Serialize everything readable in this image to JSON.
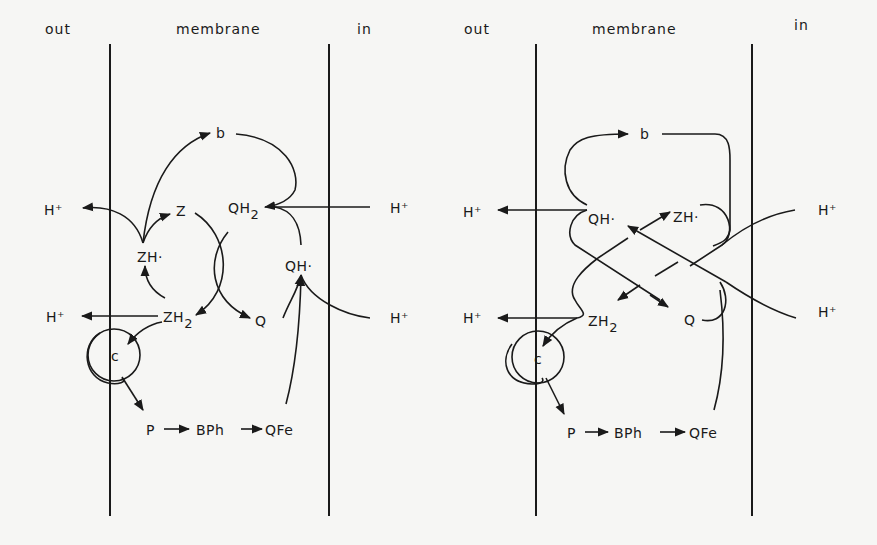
{
  "panels": [
    {
      "id": "left",
      "headers": {
        "out": "out",
        "membrane": "membrane",
        "in": "in"
      },
      "species": {
        "b": "b",
        "Z": "Z",
        "QH2": "QH",
        "QH2_sub": "2",
        "ZH_radical": "ZH·",
        "QH_radical": "QH·",
        "ZH2": "ZH",
        "ZH2_sub": "2",
        "Q": "Q",
        "c": "c",
        "P": "P",
        "BPh": "BPh",
        "QFe": "QFe"
      },
      "protons": {
        "out_top": "H⁺",
        "out_bottom": "H⁺",
        "in_top": "H⁺",
        "in_bottom": "H⁺"
      }
    },
    {
      "id": "right",
      "headers": {
        "out": "out",
        "membrane": "membrane",
        "in": "in"
      },
      "species": {
        "b": "b",
        "QH_radical": "QH·",
        "ZH_radical": "ZH·",
        "ZH2": "ZH",
        "ZH2_sub": "2",
        "Q": "Q",
        "c": "c",
        "P": "P",
        "BPh": "BPh",
        "QFe": "QFe"
      },
      "protons": {
        "out_top": "H⁺",
        "out_bottom": "H⁺",
        "in_top": "H⁺",
        "in_bottom": "H⁺"
      }
    }
  ],
  "colors": {
    "ink": "#1a1a1a",
    "paper": "#f6f6f4"
  }
}
